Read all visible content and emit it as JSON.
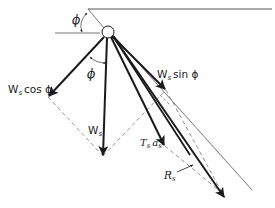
{
  "diagram": {
    "type": "force-vector-diagram",
    "colors": {
      "ink": "#1a1a1a",
      "dashed": "#777777",
      "thin": "#555555",
      "background": "#ffffff"
    },
    "labels": {
      "phi_top": "ϕ",
      "phi_mid": "ϕ",
      "w_cos_main": "W",
      "w_cos_sub": "s",
      "w_cos_rest": "cos ϕ",
      "w_sin_main": "W",
      "w_sin_sub": "s",
      "w_sin_rest": "sin ϕ",
      "ws_main": "W",
      "ws_sub": "s",
      "tsas_t": "T",
      "tsas_t_sub": "s",
      "tsas_a": "a",
      "tsas_a_sub": "s",
      "rs_main": "R",
      "rs_sub": "s"
    },
    "vectors": [
      {
        "name": "W_s cos phi",
        "from": [
          105,
          37
        ],
        "to": [
          48,
          97
        ]
      },
      {
        "name": "W_s",
        "from": [
          107,
          39
        ],
        "to": [
          103,
          156
        ]
      },
      {
        "name": "W_s sin phi",
        "from": [
          112,
          37
        ],
        "to": [
          166,
          90
        ]
      },
      {
        "name": "T_s a_s",
        "from": [
          111,
          38
        ],
        "to": [
          165,
          146
        ]
      },
      {
        "name": "R_s",
        "from": [
          112,
          37
        ],
        "to": [
          225,
          198
        ]
      }
    ]
  }
}
